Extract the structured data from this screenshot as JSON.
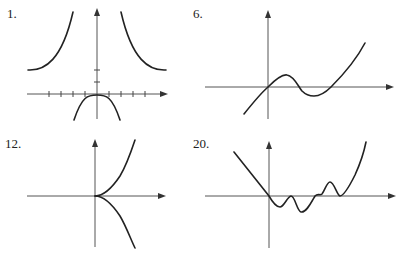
{
  "graphs": [
    {
      "label": "1.",
      "description": "Even function with vertical asymptotes, horizontal asymptote y=2, downward parabola near origin",
      "ticks_x": 8,
      "ticks_y": 2
    },
    {
      "label": "6.",
      "description": "Odd-like cubic curve through origin with local max and local min, rising to the right"
    },
    {
      "label": "12.",
      "description": "Cusp at origin: upper branch rising right, lower branch falling right"
    },
    {
      "label": "20.",
      "description": "Oscillating curve through origin: linear decreasing left side, wiggles near x-axis, rising steeply right"
    }
  ],
  "colors": {
    "curve": "#222222",
    "axis": "#555555",
    "background": "#ffffff"
  }
}
